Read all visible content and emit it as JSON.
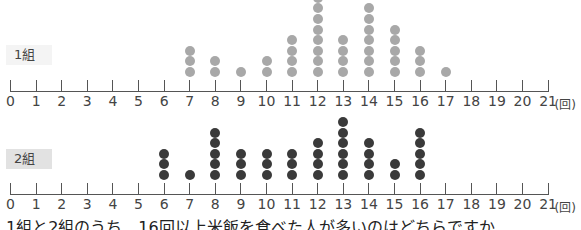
{
  "chart_data": [
    {
      "type": "scatter",
      "subtype": "dot-plot",
      "title": "1組",
      "xlabel": "(回)",
      "ylabel": "",
      "x_ticks": [
        0,
        1,
        2,
        3,
        4,
        5,
        6,
        7,
        8,
        9,
        10,
        11,
        12,
        13,
        14,
        15,
        16,
        17,
        18,
        19,
        20,
        21
      ],
      "xlim": [
        0,
        21
      ],
      "dot_color": "#a8a8a8",
      "categories": [
        7,
        8,
        9,
        10,
        11,
        12,
        13,
        14,
        15,
        16,
        17
      ],
      "values": [
        3,
        2,
        1,
        2,
        4,
        8,
        4,
        7,
        5,
        3,
        1
      ]
    },
    {
      "type": "scatter",
      "subtype": "dot-plot",
      "title": "2組",
      "xlabel": "(回)",
      "ylabel": "",
      "x_ticks": [
        0,
        1,
        2,
        3,
        4,
        5,
        6,
        7,
        8,
        9,
        10,
        11,
        12,
        13,
        14,
        15,
        16,
        17,
        18,
        19,
        20,
        21
      ],
      "xlim": [
        0,
        21
      ],
      "dot_color": "#3a3a3a",
      "categories": [
        6,
        7,
        8,
        9,
        10,
        11,
        12,
        13,
        14,
        15,
        16
      ],
      "values": [
        3,
        1,
        5,
        3,
        3,
        3,
        4,
        6,
        4,
        2,
        5
      ]
    }
  ],
  "panels": [
    {
      "label": "1組",
      "label_bg": "#f4f4f4"
    },
    {
      "label": "2組",
      "label_bg": "#e2e2e2"
    }
  ],
  "tick_labels": [
    "0",
    "1",
    "2",
    "3",
    "4",
    "5",
    "6",
    "7",
    "8",
    "9",
    "10",
    "11",
    "12",
    "13",
    "14",
    "15",
    "16",
    "17",
    "18",
    "19",
    "20",
    "21"
  ],
  "unit_label": "(回)",
  "question": "1組と2組のうち、16回以上米飯を食べた人が多いのはどちらですか"
}
